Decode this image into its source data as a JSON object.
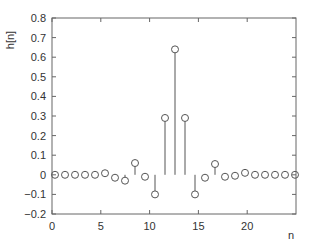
{
  "chart_data": {
    "type": "stem",
    "title": "",
    "xlabel": "n",
    "ylabel": "h[n]",
    "xlim": [
      0,
      25
    ],
    "ylim": [
      -0.2,
      0.8
    ],
    "x_ticks": [
      0,
      5,
      10,
      15,
      20
    ],
    "x_tick_labels": [
      "0",
      "5",
      "10",
      "15",
      "20"
    ],
    "y_ticks": [
      -0.2,
      -0.1,
      0,
      0.1,
      0.2,
      0.3,
      0.4,
      0.5,
      0.6,
      0.7,
      0.8
    ],
    "y_tick_labels": [
      "−0.2",
      "−0.1",
      "0",
      "0.1",
      "0.2",
      "0.3",
      "0.4",
      "0.5",
      "0.6",
      "0.7",
      "0.8"
    ],
    "grid": false,
    "marker": "open-circle",
    "color": "#555555",
    "x": [
      0,
      1,
      2,
      3,
      4,
      5,
      6,
      7,
      8,
      9,
      10,
      11,
      12,
      13,
      14,
      15,
      16,
      17,
      18,
      19,
      20,
      21,
      22,
      23,
      24
    ],
    "values": [
      0,
      0,
      0,
      0,
      0,
      0.008,
      -0.015,
      -0.03,
      0.06,
      -0.01,
      -0.1,
      0.29,
      0.64,
      0.29,
      -0.1,
      -0.015,
      0.055,
      -0.01,
      -0.005,
      0.01,
      0,
      0,
      0,
      0,
      0
    ]
  },
  "plot_layout": {
    "left": 52,
    "right": 296,
    "top": 18,
    "bottom": 214,
    "point_x_start": 55,
    "point_spacing": 10
  }
}
